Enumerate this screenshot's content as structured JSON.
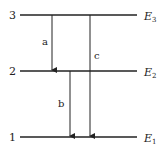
{
  "diagram": {
    "type": "energy-level-diagram",
    "levels": [
      {
        "id": "3",
        "number": "3",
        "energy_symbol": "E",
        "energy_sub": "3",
        "y": 15
      },
      {
        "id": "2",
        "number": "2",
        "energy_symbol": "E",
        "energy_sub": "2",
        "y": 71
      },
      {
        "id": "1",
        "number": "1",
        "energy_symbol": "E",
        "energy_sub": "1",
        "y": 137
      }
    ],
    "transitions": [
      {
        "label": "a",
        "from": "3",
        "to": "2",
        "x": 52
      },
      {
        "label": "b",
        "from": "2",
        "to": "1",
        "x": 70
      },
      {
        "label": "c",
        "from": "3",
        "to": "1",
        "x": 90
      }
    ],
    "line_color": "#222222"
  }
}
